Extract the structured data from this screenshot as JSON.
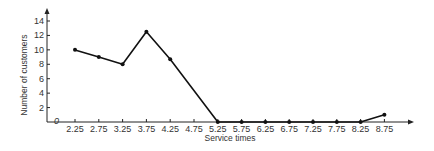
{
  "chart_data": {
    "type": "line",
    "title": "",
    "xlabel": "Service times",
    "ylabel": "Number of customers",
    "x": [
      2.25,
      2.75,
      3.25,
      3.75,
      4.25,
      4.75,
      5.25,
      5.75,
      6.25,
      6.75,
      7.25,
      7.75,
      8.25,
      8.75
    ],
    "categories": [
      "2.25",
      "2.75",
      "3.25",
      "3.75",
      "4.25",
      "4.75",
      "5.25",
      "5.75",
      "6.25",
      "6.75",
      "7.25",
      "7.75",
      "8.25",
      "8.75"
    ],
    "series": [
      {
        "name": "Number of customers",
        "points": [
          {
            "x": 2.25,
            "y": 10
          },
          {
            "x": 2.75,
            "y": 9
          },
          {
            "x": 3.25,
            "y": 8
          },
          {
            "x": 3.75,
            "y": 12.5
          },
          {
            "x": 4.25,
            "y": 8.7
          },
          {
            "x": 5.25,
            "y": 0
          },
          {
            "x": 5.75,
            "y": 0
          },
          {
            "x": 6.25,
            "y": 0
          },
          {
            "x": 6.75,
            "y": 0
          },
          {
            "x": 7.25,
            "y": 0
          },
          {
            "x": 7.75,
            "y": 0
          },
          {
            "x": 8.25,
            "y": 0
          },
          {
            "x": 8.75,
            "y": 1
          }
        ]
      }
    ],
    "yticks": [
      2,
      4,
      6,
      8,
      10,
      12,
      14
    ],
    "origin_label": "0",
    "ylim": [
      0,
      15
    ],
    "xlim": [
      1.75,
      9.5
    ],
    "grid": false,
    "legend": "none",
    "colors": {
      "line": "#111111",
      "axis": "#222222",
      "text": "#333333"
    }
  }
}
